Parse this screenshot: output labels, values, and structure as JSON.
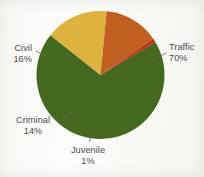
{
  "chart_data": {
    "type": "pie",
    "title": "",
    "subtitle": "",
    "xlabel": "",
    "ylabel": "",
    "grid": false,
    "legend_position": "none",
    "labels_inline": true,
    "categories": [
      "Traffic",
      "Civil",
      "Criminal",
      "Juvenile"
    ],
    "values": [
      70,
      16,
      14,
      1
    ],
    "value_unit": "%",
    "slices": [
      {
        "name": "Traffic",
        "value": 70,
        "value_label": "70%",
        "color": "#44681d"
      },
      {
        "name": "Civil",
        "value": 16,
        "value_label": "16%",
        "color": "#ddb23e"
      },
      {
        "name": "Criminal",
        "value": 14,
        "value_label": "14%",
        "color": "#c0601f"
      },
      {
        "name": "Juvenile",
        "value": 1,
        "value_label": "1%",
        "color": "#c4301a"
      }
    ],
    "annotations": [
      {
        "text": "Traffic 70%",
        "position": "right"
      },
      {
        "text": "Civil 16%",
        "position": "left"
      },
      {
        "text": "Criminal 14%",
        "position": "lower-left"
      },
      {
        "text": "Juvenile 1%",
        "position": "bottom"
      }
    ]
  },
  "labels": {
    "traffic": {
      "name": "Traffic",
      "pct": "70%"
    },
    "civil": {
      "name": "Civil",
      "pct": "16%"
    },
    "criminal": {
      "name": "Criminal",
      "pct": "14%"
    },
    "juvenile": {
      "name": "Juvenile",
      "pct": "1%"
    }
  },
  "colors": {
    "traffic": "#44681d",
    "civil": "#ddb23e",
    "criminal": "#c0601f",
    "juvenile": "#c4301a",
    "background": "#fbfbf9",
    "label_text": "#4b4b4b",
    "leader_line": "#6d6d6d"
  }
}
